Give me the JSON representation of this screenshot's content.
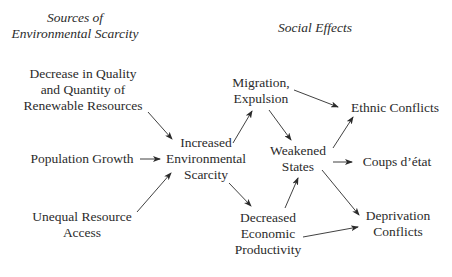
{
  "headings": {
    "sources_line1": "Sources of",
    "sources_line2": "Environmental Scarcity",
    "effects": "Social Effects"
  },
  "nodes": {
    "decrease_quality": [
      "Decrease in Quality",
      "and Quantity of",
      "Renewable Resources"
    ],
    "population_growth": [
      "Population Growth"
    ],
    "unequal_access": [
      "Unequal Resource",
      "Access"
    ],
    "increased_scarcity": [
      "Increased",
      "Environmental",
      "Scarcity"
    ],
    "migration": [
      "Migration,",
      "Expulsion"
    ],
    "weakened_states": [
      "Weakened",
      "States"
    ],
    "decreased_productivity": [
      "Decreased",
      "Economic",
      "Productivity"
    ],
    "ethnic_conflicts": [
      "Ethnic Conflicts"
    ],
    "coups": [
      "Coups d’état"
    ],
    "deprivation_conflicts": [
      "Deprivation",
      "Conflicts"
    ]
  },
  "edges": [
    {
      "from": "Decrease in Quality and Quantity of Renewable Resources",
      "to": "Increased Environmental Scarcity"
    },
    {
      "from": "Population Growth",
      "to": "Increased Environmental Scarcity"
    },
    {
      "from": "Unequal Resource Access",
      "to": "Increased Environmental Scarcity"
    },
    {
      "from": "Increased Environmental Scarcity",
      "to": "Migration, Expulsion"
    },
    {
      "from": "Increased Environmental Scarcity",
      "to": "Decreased Economic Productivity"
    },
    {
      "from": "Migration, Expulsion",
      "to": "Ethnic Conflicts"
    },
    {
      "from": "Migration, Expulsion",
      "to": "Weakened States"
    },
    {
      "from": "Decreased Economic Productivity",
      "to": "Weakened States"
    },
    {
      "from": "Decreased Economic Productivity",
      "to": "Deprivation Conflicts"
    },
    {
      "from": "Weakened States",
      "to": "Ethnic Conflicts"
    },
    {
      "from": "Weakened States",
      "to": "Coups d’état"
    },
    {
      "from": "Weakened States",
      "to": "Deprivation Conflicts"
    }
  ]
}
